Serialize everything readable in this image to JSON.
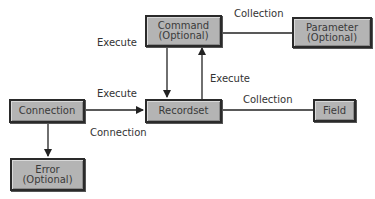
{
  "nodes": {
    "command": {
      "lines": [
        "Command",
        "(Optional)"
      ]
    },
    "parameter": {
      "lines": [
        "Parameter",
        "(Optional)"
      ]
    },
    "connection": {
      "lines": [
        "Connection"
      ]
    },
    "recordset": {
      "lines": [
        "Recordset"
      ]
    },
    "field": {
      "lines": [
        "Field"
      ]
    },
    "error": {
      "lines": [
        "Error",
        "(Optional)"
      ]
    }
  },
  "edges": {
    "command_to_recordset": {
      "label": "Execute",
      "directed": true
    },
    "recordset_to_command": {
      "label": "Execute",
      "directed": true
    },
    "command_to_parameter": {
      "label": "Collection",
      "directed": false
    },
    "connection_to_recordset": {
      "label": "Execute",
      "directed": true
    },
    "recordset_connection": {
      "label": "Connection",
      "directed": false
    },
    "recordset_to_field": {
      "label": "Collection",
      "directed": false
    },
    "connection_to_error": {
      "label": "",
      "directed": true
    }
  },
  "colors": {
    "box_fill": "#b4b4b4",
    "box_border": "#2a2a2a",
    "line": "#222222"
  }
}
